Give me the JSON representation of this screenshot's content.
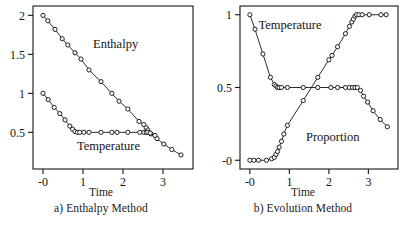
{
  "figure": {
    "width": 404,
    "height": 226,
    "background": "#ffffff",
    "ink": "#141414"
  },
  "panels": [
    {
      "id": "panel-a",
      "caption": "a) Enthalpy Method",
      "xaxis_title": "Time",
      "series_labels": [
        "Enthalpy",
        "Temperature"
      ]
    },
    {
      "id": "panel-b",
      "caption": "b) Evolution Method",
      "xaxis_title": "Time",
      "series_labels": [
        "Temperature",
        "Proportion"
      ]
    }
  ],
  "chart_data": [
    {
      "type": "line",
      "title": "a) Enthalpy Method",
      "xlabel": "Time",
      "ylabel": "",
      "xlim": [
        -0.25,
        3.75
      ],
      "ylim": [
        0.03,
        2.12
      ],
      "grid": false,
      "legend": "inline-annotations",
      "xticks": [
        0,
        1,
        2,
        3
      ],
      "xticklabels": [
        "-0",
        "1",
        "2",
        "3"
      ],
      "yticks": [
        0.5,
        1,
        1.5,
        2
      ],
      "yticklabels": [
        "0.5",
        "1",
        "1.5",
        "2"
      ],
      "marker": "open-circle",
      "annotations": [
        {
          "text": "Enthalpy",
          "x": 1.25,
          "y": 1.58
        },
        {
          "text": "Temperature",
          "x": 0.85,
          "y": 0.28
        }
      ],
      "series": [
        {
          "name": "Enthalpy",
          "x": [
            0.0,
            0.12,
            0.3,
            0.48,
            0.62,
            0.8,
            0.95,
            1.15,
            1.45,
            1.72,
            1.9,
            2.12,
            2.4,
            2.52,
            2.58,
            2.62,
            2.7,
            2.85,
            3.02,
            3.22,
            3.45
          ],
          "y": [
            2.0,
            1.93,
            1.82,
            1.7,
            1.62,
            1.52,
            1.44,
            1.3,
            1.15,
            1.0,
            0.9,
            0.8,
            0.64,
            0.6,
            0.56,
            0.53,
            0.48,
            0.42,
            0.35,
            0.28,
            0.21
          ]
        },
        {
          "name": "Temperature",
          "x": [
            0.0,
            0.13,
            0.28,
            0.42,
            0.55,
            0.67,
            0.74,
            0.8,
            0.86,
            0.92,
            1.02,
            1.15,
            1.45,
            1.72,
            1.85,
            2.12,
            2.42,
            2.52,
            2.58,
            2.62,
            2.68,
            2.8
          ],
          "y": [
            1.0,
            0.92,
            0.82,
            0.74,
            0.66,
            0.58,
            0.54,
            0.51,
            0.5,
            0.5,
            0.5,
            0.5,
            0.5,
            0.5,
            0.5,
            0.5,
            0.5,
            0.5,
            0.5,
            0.5,
            0.49,
            0.46
          ]
        }
      ]
    },
    {
      "type": "line",
      "title": "b) Evolution Method",
      "xlabel": "Time",
      "ylabel": "",
      "xlim": [
        -0.25,
        3.75
      ],
      "ylim": [
        -0.06,
        1.06
      ],
      "grid": false,
      "legend": "inline-annotations",
      "xticks": [
        0,
        1,
        2,
        3
      ],
      "xticklabels": [
        "-0",
        "1",
        "2",
        "3"
      ],
      "yticks": [
        0,
        0.5,
        1
      ],
      "yticklabels": [
        "-0",
        "0.5",
        "1"
      ],
      "marker": "open-circle",
      "annotations": [
        {
          "text": "Temperature",
          "x": 0.22,
          "y": 0.9
        },
        {
          "text": "Proportion",
          "x": 1.42,
          "y": 0.13
        }
      ],
      "series": [
        {
          "name": "Temperature",
          "x": [
            0.0,
            0.13,
            0.33,
            0.52,
            0.62,
            0.66,
            0.7,
            0.74,
            0.8,
            0.95,
            1.35,
            1.72,
            2.05,
            2.22,
            2.42,
            2.52,
            2.6,
            2.66,
            2.72,
            2.8,
            2.88,
            2.98,
            3.12,
            3.3,
            3.48
          ],
          "y": [
            1.0,
            0.9,
            0.73,
            0.57,
            0.52,
            0.51,
            0.5,
            0.5,
            0.5,
            0.5,
            0.5,
            0.5,
            0.5,
            0.5,
            0.5,
            0.5,
            0.5,
            0.5,
            0.5,
            0.48,
            0.44,
            0.4,
            0.34,
            0.28,
            0.23
          ]
        },
        {
          "name": "Proportion",
          "x": [
            0.0,
            0.1,
            0.22,
            0.42,
            0.55,
            0.62,
            0.66,
            0.7,
            0.74,
            0.8,
            0.86,
            0.95,
            1.35,
            1.72,
            2.0,
            2.08,
            2.22,
            2.42,
            2.52,
            2.58,
            2.62,
            2.66,
            2.7,
            2.76,
            2.84,
            3.02,
            3.32,
            3.45
          ],
          "y": [
            0.0,
            0.0,
            0.0,
            0.0,
            0.01,
            0.02,
            0.04,
            0.06,
            0.09,
            0.13,
            0.18,
            0.24,
            0.41,
            0.57,
            0.69,
            0.72,
            0.78,
            0.87,
            0.92,
            0.95,
            0.97,
            0.99,
            1.0,
            1.0,
            1.0,
            1.0,
            1.0,
            1.0
          ]
        }
      ]
    }
  ]
}
